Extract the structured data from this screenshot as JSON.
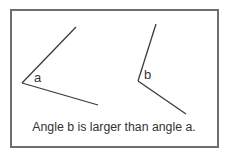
{
  "diagram": {
    "angles": [
      {
        "label": "a",
        "vertex": [
          22,
          83
        ],
        "arm1_end": [
          76,
          27
        ],
        "arm2_end": [
          98,
          105
        ]
      },
      {
        "label": "b",
        "vertex": [
          138,
          81
        ],
        "arm1_end": [
          156,
          24
        ],
        "arm2_end": [
          186,
          114
        ]
      }
    ],
    "caption": "Angle b is larger than angle a.",
    "colors": {
      "line": "#3a3a3a",
      "border": "#6e6e6e",
      "text": "#333333"
    }
  }
}
